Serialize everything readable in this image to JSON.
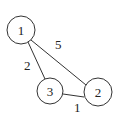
{
  "diagram": {
    "type": "weighted-undirected-graph",
    "nodes": [
      {
        "id": "1",
        "label": "1",
        "cx": 21,
        "cy": 30,
        "r": 14
      },
      {
        "id": "2",
        "label": "2",
        "cx": 98,
        "cy": 92,
        "r": 14
      },
      {
        "id": "3",
        "label": "3",
        "cx": 50,
        "cy": 91,
        "r": 13
      }
    ],
    "edges": [
      {
        "from": "1",
        "to": "2",
        "weight": "5",
        "lx": 58,
        "ly": 48
      },
      {
        "from": "1",
        "to": "3",
        "weight": "2",
        "lx": 29,
        "ly": 70
      },
      {
        "from": "3",
        "to": "2",
        "weight": "1",
        "lx": 77,
        "ly": 112
      }
    ]
  }
}
